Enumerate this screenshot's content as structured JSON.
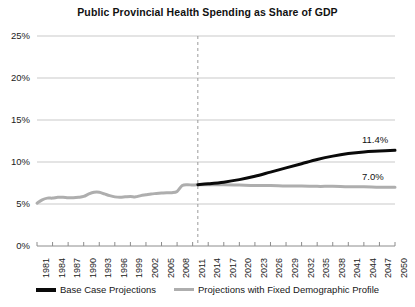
{
  "chart_data": {
    "type": "line",
    "title": "Public Provincial Health Spending as Share of GDP",
    "xlabel": "",
    "ylabel": "",
    "ylim": [
      0,
      25
    ],
    "yticks": [
      "0%",
      "5%",
      "10%",
      "15%",
      "20%",
      "25%"
    ],
    "ytick_values": [
      0,
      5,
      10,
      15,
      20,
      25
    ],
    "xlim": [
      1981,
      2050
    ],
    "xticks": [
      "1981",
      "1984",
      "1987",
      "1990",
      "1993",
      "1996",
      "1999",
      "2002",
      "2005",
      "2008",
      "2011",
      "2014",
      "2017",
      "2020",
      "2023",
      "2026",
      "2029",
      "2032",
      "2035",
      "2038",
      "2041",
      "2044",
      "2047",
      "2050"
    ],
    "xtick_values": [
      1981,
      1984,
      1987,
      1990,
      1993,
      1996,
      1999,
      2002,
      2005,
      2008,
      2011,
      2014,
      2017,
      2020,
      2023,
      2026,
      2029,
      2032,
      2035,
      2038,
      2041,
      2044,
      2047,
      2050
    ],
    "grid": "horizontal",
    "legend_position": "bottom",
    "projection_divider_year": 2012,
    "annotations": [
      {
        "text": "11.4%",
        "series": "Base Case Projections",
        "x": 2050,
        "y": 11.4
      },
      {
        "text": "7.0%",
        "series": "Projections with Fixed Demographic Profile",
        "x": 2050,
        "y": 7.0
      }
    ],
    "series": [
      {
        "name": "Base Case Projections",
        "color": "#0a0a0a",
        "width": 3,
        "x": [
          2012,
          2014,
          2017,
          2020,
          2023,
          2026,
          2029,
          2032,
          2035,
          2038,
          2041,
          2044,
          2047,
          2050
        ],
        "values": [
          7.3,
          7.4,
          7.6,
          7.9,
          8.3,
          8.8,
          9.3,
          9.8,
          10.3,
          10.7,
          11.0,
          11.2,
          11.3,
          11.4
        ]
      },
      {
        "name": "Projections with Fixed Demographic Profile",
        "color": "#aeaeae",
        "width": 3,
        "x": [
          2012,
          2014,
          2017,
          2020,
          2023,
          2026,
          2029,
          2032,
          2035,
          2038,
          2041,
          2044,
          2047,
          2050
        ],
        "values": [
          7.3,
          7.3,
          7.3,
          7.25,
          7.2,
          7.2,
          7.15,
          7.15,
          7.1,
          7.1,
          7.05,
          7.05,
          7.0,
          7.0
        ]
      },
      {
        "name": "Historical",
        "color": "#aeaeae",
        "width": 3,
        "x": [
          1981,
          1982,
          1983,
          1984,
          1985,
          1986,
          1987,
          1988,
          1989,
          1990,
          1991,
          1992,
          1993,
          1994,
          1995,
          1996,
          1997,
          1998,
          1999,
          2000,
          2001,
          2002,
          2003,
          2004,
          2005,
          2006,
          2007,
          2008,
          2009,
          2010,
          2011,
          2012
        ],
        "values": [
          5.1,
          5.5,
          5.7,
          5.7,
          5.8,
          5.8,
          5.75,
          5.75,
          5.8,
          5.9,
          6.2,
          6.4,
          6.4,
          6.2,
          6.0,
          5.85,
          5.8,
          5.85,
          5.9,
          5.85,
          6.0,
          6.1,
          6.2,
          6.25,
          6.3,
          6.35,
          6.35,
          6.5,
          7.2,
          7.3,
          7.25,
          7.3
        ]
      }
    ]
  },
  "legend": {
    "items": [
      {
        "label": "Base Case Projections"
      },
      {
        "label": "Projections with Fixed Demographic Profile"
      }
    ]
  }
}
